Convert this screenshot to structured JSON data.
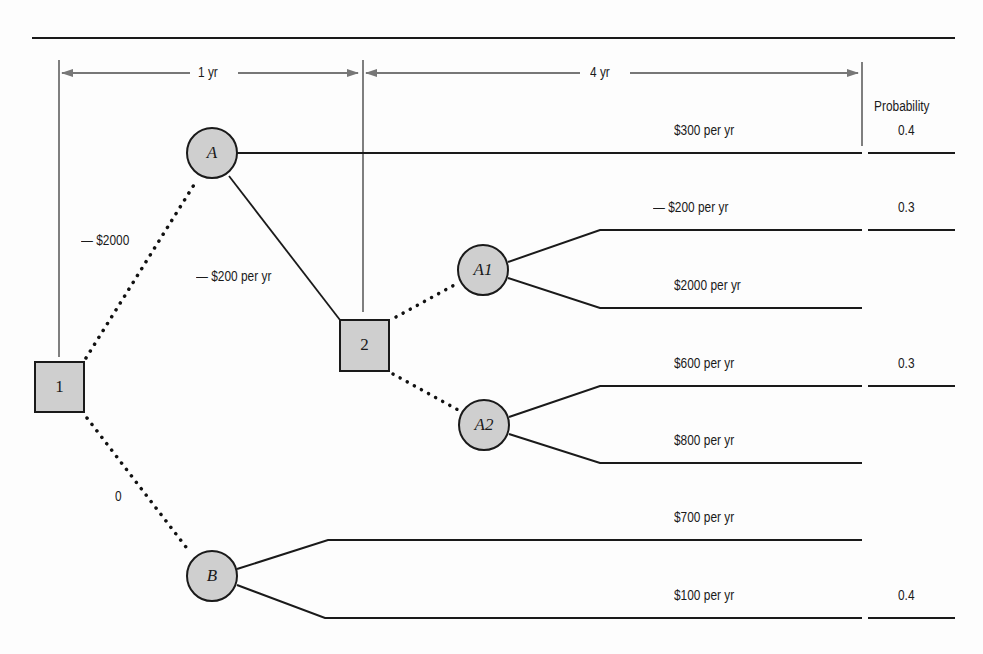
{
  "timeline": {
    "period1_label": "1 yr",
    "period2_label": "4 yr",
    "probability_header": "Probability"
  },
  "nodes": {
    "decision1": {
      "label": "1",
      "type": "decision"
    },
    "decision2": {
      "label": "2",
      "type": "decision"
    },
    "chanceA": {
      "label": "A",
      "type": "chance"
    },
    "chanceA1": {
      "label": "A1",
      "type": "chance"
    },
    "chanceA2": {
      "label": "A2",
      "type": "chance"
    },
    "chanceB": {
      "label": "B",
      "type": "chance"
    }
  },
  "edges": {
    "d1_to_A": "— $2000",
    "d1_to_B": "0",
    "A_to_d2": "— $200 per yr"
  },
  "outcomes": [
    {
      "label": "$300 per yr",
      "probability": "0.4"
    },
    {
      "label": "— $200 per yr",
      "probability": "0.3"
    },
    {
      "label": "$2000 per yr",
      "probability": ""
    },
    {
      "label": "$600 per yr",
      "probability": "0.3"
    },
    {
      "label": "$800 per yr",
      "probability": ""
    },
    {
      "label": "$700 per yr",
      "probability": ""
    },
    {
      "label": "$100 per yr",
      "probability": "0.4"
    }
  ],
  "colors": {
    "node_fill": "#cfcfcf",
    "line": "#1a1a1a",
    "arrow": "#777777"
  }
}
